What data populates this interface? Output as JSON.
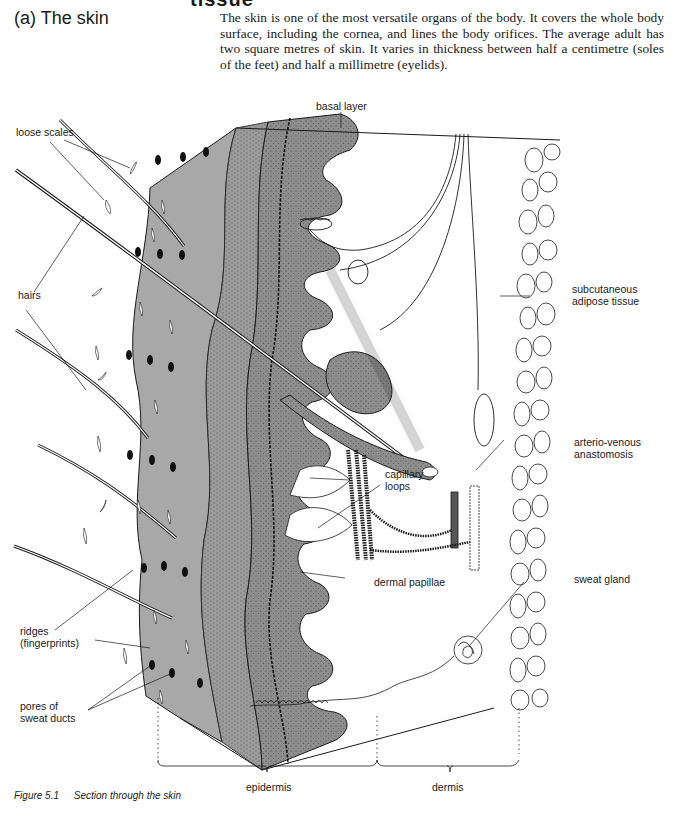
{
  "page": {
    "cut_heading": "tissue",
    "section_title": "(a) The skin",
    "intro_text": "The skin is one of the most versatile organs of the body. It covers the whole body surface, including the cornea, and lines the body orifices. The average adult has two square metres of skin. It varies in thickness between half a centimetre (soles of the feet) and half a millimetre (eyelids)."
  },
  "figure": {
    "number": "Figure 5.1",
    "caption": "Section through the skin",
    "labels": {
      "basal_layer": "basal layer",
      "loose_scales": "loose scales",
      "hairs": "hairs",
      "subcutaneous": "subcutaneous\nadipose tissue",
      "arterio_venous": "arterio-venous\nanastomosis",
      "capillary_loops": "capillary\nloops",
      "dermal_papillae": "dermal papillae",
      "sweat_gland": "sweat gland",
      "ridges": "ridges\n(fingerprints)",
      "pores": "pores of\nsweat ducts",
      "epidermis": "epidermis",
      "dermis": "dermis"
    },
    "colors": {
      "outer_layer": "#a8a8a8",
      "inner_layer": "#9a9a9a",
      "basal_layer": "#8e8e8e",
      "ink": "#1a1a1a",
      "paper": "#ffffff"
    }
  }
}
